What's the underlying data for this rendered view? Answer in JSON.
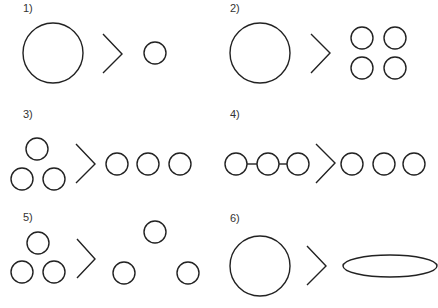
{
  "panels": [
    {
      "label": "1)",
      "description": "large circle > small circle"
    },
    {
      "label": "2)",
      "description": "large circle > four small circles in 2x2 grid"
    },
    {
      "label": "3)",
      "description": "three circles in triangle > three circles in a row"
    },
    {
      "label": "4)",
      "description": "three connected circles > three separate circles"
    },
    {
      "label": "5)",
      "description": "three close circles in triangle > three spread-out circles in triangle"
    },
    {
      "label": "6)",
      "description": "circle > flat ellipse"
    }
  ],
  "comparison_symbol": ">"
}
